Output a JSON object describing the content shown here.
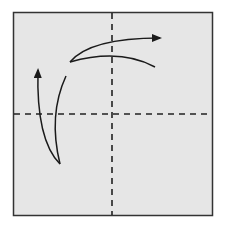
{
  "diagram": {
    "type": "origami-fold-instruction",
    "colors": {
      "background": "#ffffff",
      "paper": "#e6e6e6",
      "border": "#333333",
      "lines": "#222222"
    },
    "paper": {
      "x": 13,
      "y": 12,
      "width": 200,
      "height": 204
    },
    "fold_lines": [
      {
        "name": "vertical-center-fold",
        "style": "dashed",
        "x1": 112,
        "y1": 12,
        "x2": 112,
        "y2": 216
      },
      {
        "name": "horizontal-center-fold",
        "style": "dashed",
        "x1": 13,
        "y1": 114,
        "x2": 213,
        "y2": 114
      }
    ],
    "arrows": [
      {
        "name": "fold-unfold-arrow-top",
        "direction": "right"
      },
      {
        "name": "fold-unfold-arrow-left",
        "direction": "up"
      }
    ]
  }
}
